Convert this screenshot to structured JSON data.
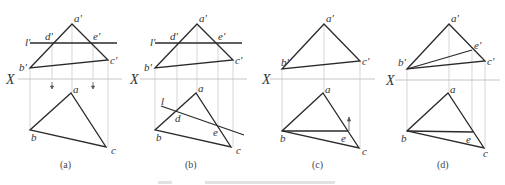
{
  "diagram": {
    "type": "descriptive-geometry-projection",
    "axis_label": "X",
    "panels": [
      {
        "caption": "(a)",
        "front_labels": {
          "a": "a'",
          "b": "b'",
          "c": "c'",
          "d": "d'",
          "e": "e'",
          "line": "l'"
        },
        "top_labels": {
          "a": "a",
          "b": "b",
          "c": "c"
        }
      },
      {
        "caption": "(b)",
        "front_labels": {
          "a": "a'",
          "b": "b'",
          "c": "c'",
          "d": "d'",
          "e": "e'",
          "line": "l'"
        },
        "top_labels": {
          "a": "a",
          "b": "b",
          "c": "c",
          "d": "d",
          "e": "e",
          "line": "l"
        }
      },
      {
        "caption": "(c)",
        "front_labels": {
          "a": "a'",
          "b": "b'",
          "c": "c'"
        },
        "top_labels": {
          "a": "a",
          "b": "b",
          "c": "c",
          "e": "e"
        }
      },
      {
        "caption": "(d)",
        "front_labels": {
          "a": "a'",
          "b": "b'",
          "c": "c'",
          "e": "e'"
        },
        "top_labels": {
          "a": "a",
          "b": "b",
          "c": "c",
          "e": "e"
        }
      }
    ]
  }
}
